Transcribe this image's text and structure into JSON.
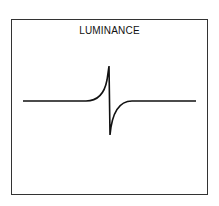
{
  "diagram": {
    "title": "LUMINANCE",
    "curve": {
      "description": "Flat baseline with sharp positive spike followed by sharp negative dip returning to baseline",
      "color": "#111111"
    }
  }
}
